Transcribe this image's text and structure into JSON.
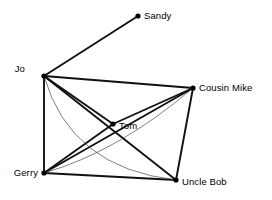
{
  "diagram": {
    "background_color": "#ffffff",
    "node_color": "#000000",
    "edge_color": "#111111",
    "thin_edge_color": "#3a3a3a"
  },
  "nodes": [
    {
      "id": "sandy",
      "label": "Sandy",
      "x": 138,
      "y": 16,
      "label_x": 144,
      "label_y": 11,
      "label_anchor": "start"
    },
    {
      "id": "jo",
      "label": "Jo",
      "x": 44,
      "y": 76,
      "label_x": 25,
      "label_y": 64,
      "label_anchor": "end"
    },
    {
      "id": "cousin_mike",
      "label": "Cousin Mike",
      "x": 193,
      "y": 88,
      "label_x": 199,
      "label_y": 83,
      "label_anchor": "start"
    },
    {
      "id": "tom",
      "label": "Tom",
      "x": 113,
      "y": 124,
      "label_x": 119,
      "label_y": 121,
      "label_anchor": "start"
    },
    {
      "id": "gerry",
      "label": "Gerry",
      "x": 44,
      "y": 173,
      "label_x": 38,
      "label_y": 168,
      "label_anchor": "end"
    },
    {
      "id": "uncle_bob",
      "label": "Uncle Bob",
      "x": 176,
      "y": 180,
      "label_x": 182,
      "label_y": 177,
      "label_anchor": "start"
    }
  ],
  "edges": [
    {
      "id": "jo-sandy",
      "from": "jo",
      "to": "sandy",
      "style": "thick",
      "curve": null
    },
    {
      "id": "jo-cousin-mike",
      "from": "jo",
      "to": "cousin_mike",
      "style": "thick",
      "curve": null
    },
    {
      "id": "jo-gerry",
      "from": "jo",
      "to": "gerry",
      "style": "thick",
      "curve": null
    },
    {
      "id": "jo-tom",
      "from": "jo",
      "to": "tom",
      "style": "thick",
      "curve": null
    },
    {
      "id": "jo-uncle-bob",
      "from": "jo",
      "to": "uncle_bob",
      "style": "thick",
      "curve": null
    },
    {
      "id": "tom-cousin-mike",
      "from": "tom",
      "to": "cousin_mike",
      "style": "thick",
      "curve": null
    },
    {
      "id": "gerry-tom",
      "from": "gerry",
      "to": "tom",
      "style": "thick",
      "curve": null
    },
    {
      "id": "gerry-cousin-mike",
      "from": "gerry",
      "to": "cousin_mike",
      "style": "thick",
      "curve": null
    },
    {
      "id": "gerry-uncle-bob",
      "from": "gerry",
      "to": "uncle_bob",
      "style": "thick",
      "curve": null
    },
    {
      "id": "cousin-mike-uncle-bob",
      "from": "cousin_mike",
      "to": "uncle_bob",
      "style": "thick",
      "curve": null
    },
    {
      "id": "jo-uncle-bob-curve",
      "from": "jo",
      "to": "uncle_bob",
      "style": "thin",
      "curve": {
        "cx": 70,
        "cy": 168
      }
    },
    {
      "id": "gerry-cousin-mike-curve",
      "from": "gerry",
      "to": "cousin_mike",
      "style": "thin",
      "curve": {
        "cx": 118,
        "cy": 152
      }
    }
  ]
}
